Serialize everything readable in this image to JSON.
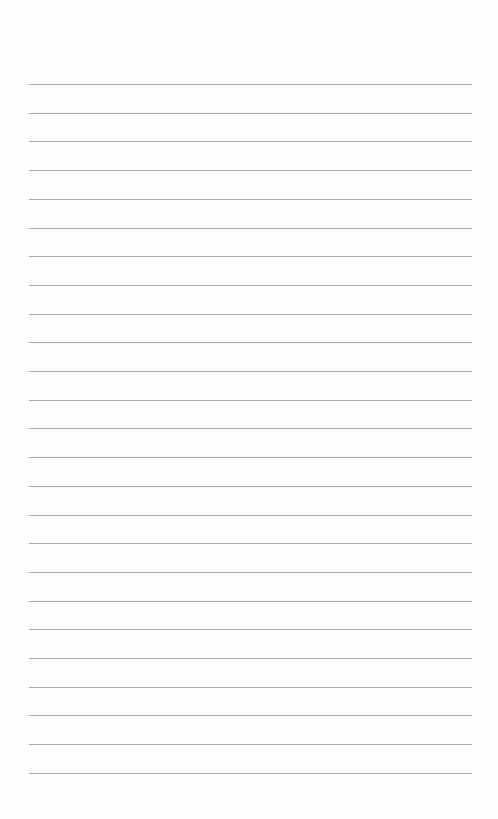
{
  "document": {
    "type": "lined-paper",
    "background_color": "#fefefe",
    "rule_color": "#a9a9a9",
    "rule_count": 25,
    "first_rule_y": 84,
    "rule_spacing": 28.7,
    "rule_left": 29,
    "rule_width": 443,
    "text": []
  }
}
